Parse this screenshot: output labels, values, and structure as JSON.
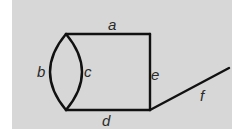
{
  "diagram": {
    "background_color": "#d7d7d7",
    "edge_color": "#111111",
    "nodes": [
      {
        "id": "top-left",
        "x": 66,
        "y": 34
      },
      {
        "id": "top-right",
        "x": 150,
        "y": 34
      },
      {
        "id": "bottom-right",
        "x": 150,
        "y": 110
      },
      {
        "id": "bottom-left",
        "x": 66,
        "y": 110
      },
      {
        "id": "f-end",
        "x": 229,
        "y": 68
      }
    ],
    "edges": [
      {
        "label": "a",
        "from": "top-left",
        "to": "top-right",
        "shape": "line"
      },
      {
        "label": "b",
        "from": "top-left",
        "to": "bottom-left",
        "shape": "left-arc"
      },
      {
        "label": "c",
        "from": "top-left",
        "to": "bottom-left",
        "shape": "right-arc"
      },
      {
        "label": "d",
        "from": "bottom-left",
        "to": "bottom-right",
        "shape": "line"
      },
      {
        "label": "e",
        "from": "top-right",
        "to": "bottom-right",
        "shape": "line"
      },
      {
        "label": "f",
        "from": "bottom-right",
        "to": "f-end",
        "shape": "line"
      }
    ],
    "labels": {
      "a": "a",
      "b": "b",
      "c": "c",
      "d": "d",
      "e": "e",
      "f": "f"
    }
  }
}
